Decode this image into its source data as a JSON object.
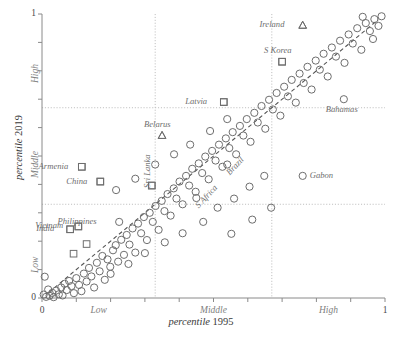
{
  "chart_data": {
    "type": "scatter",
    "title": "",
    "xlabel": "percentile 1995",
    "ylabel": "percentile 2019",
    "xlim": [
      0,
      1
    ],
    "ylim": [
      0,
      1
    ],
    "grid": true,
    "grid_lines": {
      "x": [
        0.33,
        0.67
      ],
      "y": [
        0.33,
        0.67
      ]
    },
    "x_ticks": [
      0,
      0.1,
      0.2,
      0.3,
      0.4,
      0.5,
      0.6,
      0.7,
      0.8,
      0.9,
      1
    ],
    "y_ticks": [
      0,
      0.1,
      0.2,
      0.3,
      0.4,
      0.5,
      0.6,
      0.7,
      0.8,
      0.9,
      1
    ],
    "x_tick_labels": [
      {
        "value": 0,
        "text": "0",
        "kind": "number"
      },
      {
        "value": 0.165,
        "text": "Low",
        "kind": "category"
      },
      {
        "value": 0.5,
        "text": "Middle",
        "kind": "category"
      },
      {
        "value": 0.835,
        "text": "High",
        "kind": "category"
      },
      {
        "value": 1,
        "text": "1",
        "kind": "number"
      }
    ],
    "y_tick_labels": [
      {
        "value": 0,
        "text": "0",
        "kind": "number"
      },
      {
        "value": 0.165,
        "text": "Low",
        "kind": "category"
      },
      {
        "value": 0.5,
        "text": "Middle",
        "kind": "category"
      },
      {
        "value": 0.835,
        "text": "High",
        "kind": "category"
      },
      {
        "value": 1,
        "text": "1",
        "kind": "number"
      }
    ],
    "reference_line": {
      "style": "dashed",
      "from": [
        0.02,
        0.02
      ],
      "to": [
        0.98,
        0.98
      ],
      "label": "y = x"
    },
    "series": [
      {
        "name": "unlabeled countries",
        "marker": "circle",
        "points": [
          [
            0.005,
            0.012
          ],
          [
            0.012,
            0.004
          ],
          [
            0.018,
            0.03
          ],
          [
            0.022,
            0.008
          ],
          [
            0.03,
            0.018
          ],
          [
            0.034,
            0.003
          ],
          [
            0.041,
            0.026
          ],
          [
            0.008,
            0.075
          ],
          [
            0.049,
            0.013
          ],
          [
            0.056,
            0.037
          ],
          [
            0.06,
            0.009
          ],
          [
            0.066,
            0.05
          ],
          [
            0.072,
            0.028
          ],
          [
            0.079,
            0.06
          ],
          [
            0.086,
            0.042
          ],
          [
            0.093,
            0.017
          ],
          [
            0.1,
            0.07
          ],
          [
            0.108,
            0.046
          ],
          [
            0.115,
            0.024
          ],
          [
            0.122,
            0.086
          ],
          [
            0.13,
            0.058
          ],
          [
            0.137,
            0.106
          ],
          [
            0.144,
            0.076
          ],
          [
            0.152,
            0.037
          ],
          [
            0.16,
            0.124
          ],
          [
            0.168,
            0.094
          ],
          [
            0.176,
            0.148
          ],
          [
            0.183,
            0.064
          ],
          [
            0.191,
            0.136
          ],
          [
            0.199,
            0.11
          ],
          [
            0.207,
            0.168
          ],
          [
            0.215,
            0.186
          ],
          [
            0.222,
            0.128
          ],
          [
            0.231,
            0.205
          ],
          [
            0.239,
            0.152
          ],
          [
            0.247,
            0.222
          ],
          [
            0.255,
            0.188
          ],
          [
            0.264,
            0.245
          ],
          [
            0.272,
            0.16
          ],
          [
            0.28,
            0.262
          ],
          [
            0.289,
            0.228
          ],
          [
            0.297,
            0.285
          ],
          [
            0.306,
            0.204
          ],
          [
            0.314,
            0.3
          ],
          [
            0.323,
            0.268
          ],
          [
            0.331,
            0.324
          ],
          [
            0.34,
            0.24
          ],
          [
            0.349,
            0.342
          ],
          [
            0.357,
            0.306
          ],
          [
            0.366,
            0.366
          ],
          [
            0.375,
            0.29
          ],
          [
            0.384,
            0.386
          ],
          [
            0.392,
            0.35
          ],
          [
            0.401,
            0.41
          ],
          [
            0.41,
            0.33
          ],
          [
            0.42,
            0.43
          ],
          [
            0.429,
            0.396
          ],
          [
            0.438,
            0.455
          ],
          [
            0.448,
            0.374
          ],
          [
            0.457,
            0.474
          ],
          [
            0.467,
            0.44
          ],
          [
            0.476,
            0.498
          ],
          [
            0.486,
            0.418
          ],
          [
            0.496,
            0.518
          ],
          [
            0.506,
            0.484
          ],
          [
            0.516,
            0.54
          ],
          [
            0.526,
            0.462
          ],
          [
            0.536,
            0.562
          ],
          [
            0.546,
            0.528
          ],
          [
            0.556,
            0.584
          ],
          [
            0.566,
            0.506
          ],
          [
            0.577,
            0.606
          ],
          [
            0.587,
            0.572
          ],
          [
            0.597,
            0.63
          ],
          [
            0.608,
            0.55
          ],
          [
            0.619,
            0.652
          ],
          [
            0.629,
            0.618
          ],
          [
            0.64,
            0.676
          ],
          [
            0.651,
            0.596
          ],
          [
            0.662,
            0.698
          ],
          [
            0.673,
            0.664
          ],
          [
            0.684,
            0.722
          ],
          [
            0.695,
            0.642
          ],
          [
            0.706,
            0.744
          ],
          [
            0.717,
            0.71
          ],
          [
            0.728,
            0.768
          ],
          [
            0.74,
            0.688
          ],
          [
            0.751,
            0.79
          ],
          [
            0.763,
            0.757
          ],
          [
            0.774,
            0.814
          ],
          [
            0.786,
            0.734
          ],
          [
            0.798,
            0.836
          ],
          [
            0.81,
            0.804
          ],
          [
            0.821,
            0.86
          ],
          [
            0.833,
            0.78
          ],
          [
            0.845,
            0.882
          ],
          [
            0.857,
            0.85
          ],
          [
            0.869,
            0.906
          ],
          [
            0.882,
            0.828
          ],
          [
            0.894,
            0.928
          ],
          [
            0.906,
            0.896
          ],
          [
            0.919,
            0.95
          ],
          [
            0.931,
            0.874
          ],
          [
            0.944,
            0.968
          ],
          [
            0.956,
            0.94
          ],
          [
            0.969,
            0.982
          ],
          [
            0.981,
            0.958
          ],
          [
            0.99,
            0.992
          ],
          [
            0.965,
            0.912
          ],
          [
            0.935,
            0.99
          ],
          [
            0.47,
            0.268
          ],
          [
            0.56,
            0.35
          ],
          [
            0.512,
            0.318
          ],
          [
            0.605,
            0.392
          ],
          [
            0.648,
            0.43
          ],
          [
            0.41,
            0.228
          ],
          [
            0.358,
            0.196
          ],
          [
            0.3,
            0.158
          ],
          [
            0.252,
            0.12
          ],
          [
            0.2,
            0.085
          ],
          [
            0.552,
            0.226
          ],
          [
            0.613,
            0.276
          ],
          [
            0.668,
            0.318
          ],
          [
            0.432,
            0.54
          ],
          [
            0.385,
            0.506
          ],
          [
            0.33,
            0.47
          ],
          [
            0.49,
            0.588
          ],
          [
            0.54,
            0.63
          ],
          [
            0.272,
            0.42
          ],
          [
            0.216,
            0.38
          ]
        ]
      },
      {
        "name": "highlighted squares",
        "marker": "square",
        "points": [
          [
            0.116,
            0.462
          ],
          [
            0.17,
            0.41
          ],
          [
            0.32,
            0.396
          ],
          [
            0.106,
            0.252
          ],
          [
            0.082,
            0.242
          ],
          [
            0.13,
            0.19
          ],
          [
            0.092,
            0.156
          ],
          [
            0.53,
            0.69
          ],
          [
            0.7,
            0.832
          ]
        ]
      },
      {
        "name": "highlighted triangles",
        "marker": "triangle",
        "points": [
          [
            0.35,
            0.572
          ],
          [
            0.76,
            0.96
          ]
        ]
      }
    ],
    "annotations": [
      {
        "label": "Ireland",
        "marker": "triangle",
        "x": 0.76,
        "y": 0.96,
        "label_side": "left",
        "rotation": 0
      },
      {
        "label": "S Korea",
        "marker": "square",
        "x": 0.7,
        "y": 0.832,
        "label_side": "above",
        "rotation": 0
      },
      {
        "label": "Latvia",
        "marker": "square",
        "x": 0.53,
        "y": 0.69,
        "label_side": "left",
        "rotation": 0
      },
      {
        "label": "Bahamas",
        "marker": "circle",
        "x": 0.88,
        "y": 0.7,
        "label_side": "below",
        "rotation": 0
      },
      {
        "label": "Belarus",
        "marker": "triangle",
        "x": 0.35,
        "y": 0.572,
        "label_side": "above",
        "rotation": 0
      },
      {
        "label": "Sri Lanka",
        "marker": "square",
        "x": 0.32,
        "y": 0.396,
        "label_side": "left",
        "rotation": -90
      },
      {
        "label": "China",
        "marker": "square",
        "x": 0.17,
        "y": 0.41,
        "label_side": "left",
        "rotation": 0
      },
      {
        "label": "Armenia",
        "marker": "square",
        "x": 0.116,
        "y": 0.462,
        "label_side": "left",
        "rotation": 0
      },
      {
        "label": "Philippines",
        "marker": "circle",
        "x": 0.225,
        "y": 0.268,
        "label_side": "left",
        "rotation": 0
      },
      {
        "label": "Vietnam",
        "marker": "square",
        "x": 0.106,
        "y": 0.252,
        "label_side": "left",
        "rotation": 0
      },
      {
        "label": "India",
        "marker": "square",
        "x": 0.082,
        "y": 0.242,
        "label_side": "left",
        "rotation": 0
      },
      {
        "label": "Gabon",
        "marker": "circle",
        "x": 0.76,
        "y": 0.43,
        "label_side": "right",
        "rotation": 0
      },
      {
        "label": "Brazil",
        "marker": "circle",
        "x": 0.54,
        "y": 0.47,
        "label_side": "below",
        "rotation": -47
      },
      {
        "label": "S Africa",
        "marker": "circle",
        "x": 0.45,
        "y": 0.352,
        "label_side": "below",
        "rotation": -47
      }
    ],
    "colors": {
      "marker_stroke": "#6e6e6e",
      "axis": "#8a8a8a",
      "grid": "#b9b9b9",
      "reference_line": "#555555",
      "label_text": "#6e6e6e",
      "tick_text": "#4a4a4a",
      "category_text": "#808080",
      "background": "#ffffff"
    }
  }
}
